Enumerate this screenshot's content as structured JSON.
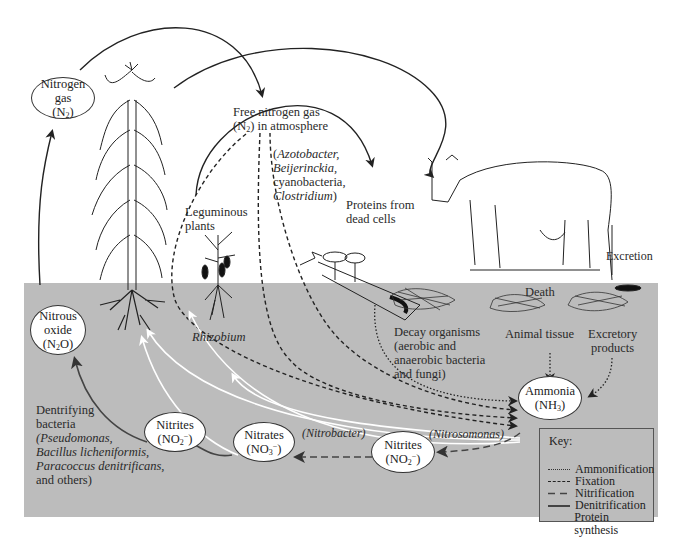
{
  "colors": {
    "soil": "#bcbcbc",
    "sky": "#ffffff",
    "denitrification": "#333333",
    "protein_synthesis": "#ffffff"
  },
  "atmosphere": {
    "nitrogen_gas": {
      "line1": "Nitrogen",
      "line2": "gas",
      "line3": "(N",
      "sub": "2",
      "line3_end": ")"
    },
    "free_nitrogen": {
      "line1": "Free nitrogen gas",
      "line2a": "(N",
      "sub": "2",
      "line2b": ") in atmosphere"
    },
    "fixers": {
      "open": "(",
      "item1": "Azotobacter,",
      "item2": "Beijerinckia,",
      "item3": "cyanobacteria,",
      "item4": "Clostridium",
      "close": ")"
    },
    "leguminous": {
      "line1": "Leguminous",
      "line2": "plants"
    },
    "proteins": {
      "line1": "Proteins from",
      "line2": "dead cells"
    },
    "excretion": "Excretion"
  },
  "soil": {
    "rhizobium": "Rhizobium",
    "nitrous_oxide": {
      "line1": "Nitrous",
      "line2": "oxide",
      "line3a": "(N",
      "sub": "2",
      "line3b": "O)"
    },
    "denitrifying": {
      "line1": "Dentrifying",
      "line2": "bacteria",
      "line3": "(Pseudomonas,",
      "line4": "Bacillus  licheniformis,",
      "line5": "Paracoccus denitrificans,",
      "line6": "and others)"
    },
    "nitrites_left": {
      "line1": "Nitrites",
      "line2a": "(NO",
      "sub": "2",
      "sup": "−",
      "line2b": ")"
    },
    "nitrates": {
      "line1": "Nitrates",
      "line2a": "(NO",
      "sub": "3",
      "sup": "−",
      "line2b": ")"
    },
    "nitrobacter": "(Nitrobacter)",
    "nitrites_right": {
      "line1": "Nitrites",
      "line2a": "(NO",
      "sub": "2",
      "sup": "−",
      "line2b": ")"
    },
    "nitrosomonas": "(Nitrosomonas)",
    "ammonia": {
      "line1": "Ammonia",
      "line2a": "(NH",
      "sub": "3",
      "line2b": ")"
    },
    "decay": {
      "line1": "Decay organisms",
      "line2": "(aerobic and",
      "line3": "anaerobic bacteria",
      "line4": "and fungi)"
    },
    "death": "Death",
    "animal_tissue": "Animal tissue",
    "excretory": {
      "line1": "Excretory",
      "line2": "products"
    }
  },
  "key": {
    "title": "Key:",
    "items": [
      {
        "label": "Ammonification",
        "style": "dotted"
      },
      {
        "label": "Fixation",
        "style": "dashed-short"
      },
      {
        "label": "Nitrification",
        "style": "dashed-long"
      },
      {
        "label": "Denitrification",
        "style": "solid-dark"
      },
      {
        "label": "Protein synthesis",
        "style": "solid-white"
      }
    ]
  }
}
